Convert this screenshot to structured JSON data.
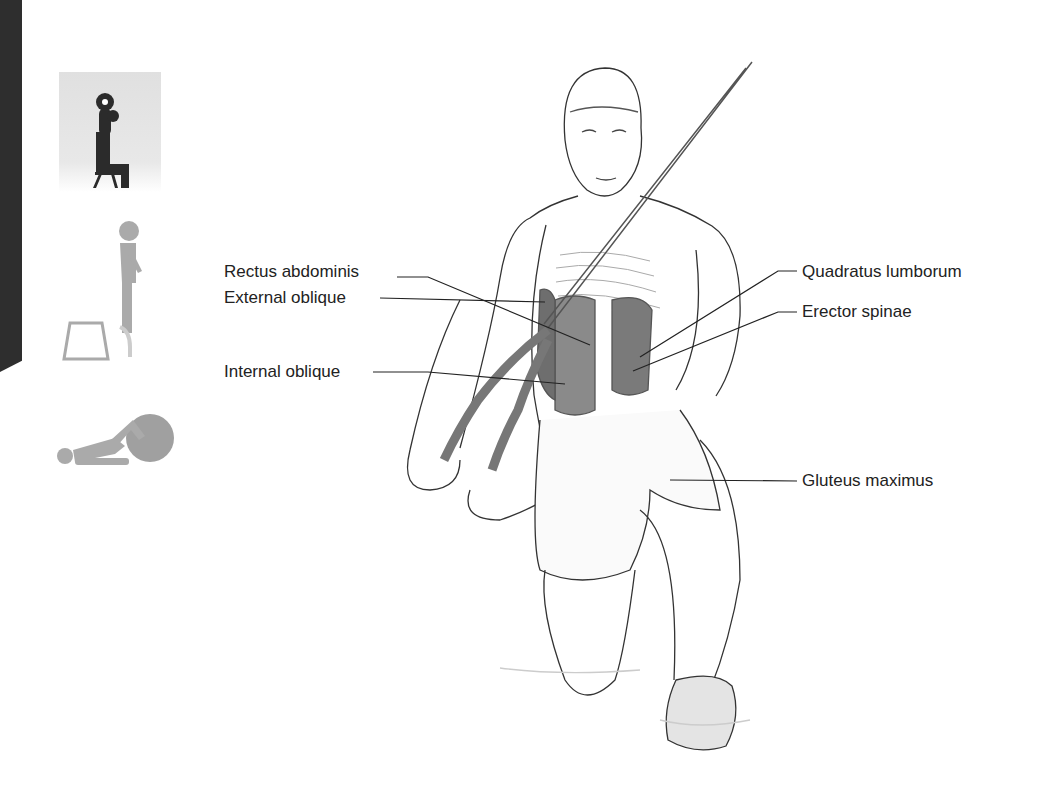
{
  "figure": {
    "type": "anatomical exercise illustration",
    "labels_left": [
      {
        "text": "Rectus abdominis",
        "x": 224,
        "y": 271
      },
      {
        "text": "External oblique",
        "x": 224,
        "y": 298
      },
      {
        "text": "Internal oblique",
        "x": 224,
        "y": 372
      }
    ],
    "labels_right": [
      {
        "text": "Quadratus lumborum",
        "x": 802,
        "y": 271
      },
      {
        "text": "Erector spinae",
        "x": 802,
        "y": 312
      },
      {
        "text": "Gluteus maximus",
        "x": 802,
        "y": 481
      }
    ]
  },
  "sidebar_icons": [
    {
      "name": "seated-dumbbell-press-icon",
      "active": true
    },
    {
      "name": "step-up-box-icon",
      "active": false
    },
    {
      "name": "stability-ball-exercise-icon",
      "active": false
    }
  ],
  "colors": {
    "edge_bar": "#2e2e2e",
    "active_icon": "#2b2b2b",
    "inactive_icon": "#aaaaaa",
    "active_icon_bg": "#e3e3e3",
    "muscle": "#6e6e6e",
    "line": "#333333"
  }
}
